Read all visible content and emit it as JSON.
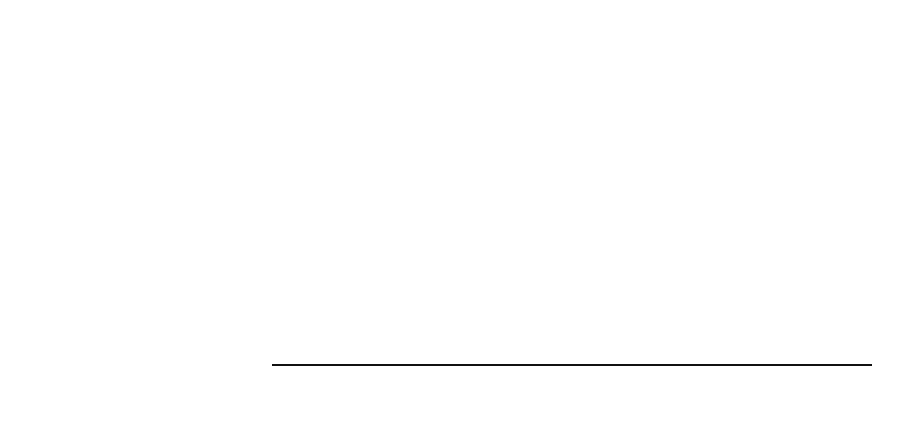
{
  "chart_data": {
    "type": "bar",
    "orientation": "horizontal",
    "categories": [
      "Atuação pública",
      "Isenção fiscal",
      "Leis de incentivo",
      "Ausência do Estado"
    ],
    "values": [
      15,
      14,
      10,
      1
    ],
    "xlabel": "",
    "ylabel": "",
    "xlim": [
      0,
      20
    ],
    "xticks": [
      "0",
      "5",
      "10",
      "15",
      "20"
    ],
    "grid": true,
    "legend": null,
    "bar_color": "#8b8b8b"
  }
}
